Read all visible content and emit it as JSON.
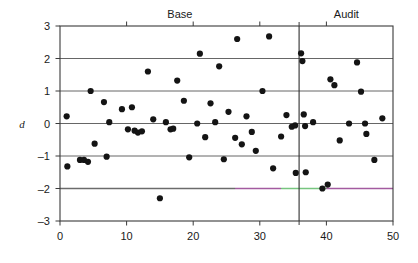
{
  "figure": {
    "title": "",
    "y_axis_title": "d",
    "panels": [
      {
        "label": "Base",
        "x_start": 0,
        "x_end": 35.9
      },
      {
        "label": "Audit",
        "x_start": 35.9,
        "x_end": 50
      }
    ]
  },
  "chart_data": {
    "type": "scatter",
    "title": "",
    "subtitle": "",
    "xlabel": "",
    "ylabel": "d",
    "xlim": [
      0,
      50
    ],
    "ylim": [
      -3,
      3
    ],
    "xticks": [
      0,
      10,
      20,
      30,
      40,
      50
    ],
    "xtick_labels": [
      "0",
      "10",
      "20",
      "30",
      "40",
      "50"
    ],
    "yticks": [
      3,
      2,
      1,
      0,
      -1,
      -2,
      -3
    ],
    "ytick_labels": [
      "3",
      "2",
      "1",
      "0",
      "-1",
      "-2",
      "-3"
    ],
    "grid": true,
    "gridlines_y": [
      2,
      1,
      0,
      -1,
      -2
    ],
    "legend": "none",
    "legend_position": "none",
    "annotations": [
      {
        "type": "panel-label",
        "text": "Base",
        "x": 18,
        "y": 3.35
      },
      {
        "type": "panel-label",
        "text": "Audit",
        "x": 43,
        "y": 3.35
      },
      {
        "type": "vertical-divider",
        "x": 35.9
      }
    ],
    "reference_line": {
      "y": -2,
      "segments": [
        {
          "x_start": 0,
          "x_end": 26.3,
          "color": "#6b6b6b"
        },
        {
          "x_start": 26.3,
          "x_end": 33.2,
          "color": "#a35ba0"
        },
        {
          "x_start": 33.2,
          "x_end": 40.0,
          "color": "#77c57f"
        },
        {
          "x_start": 40.0,
          "x_end": 50.0,
          "color": "#a35ba0"
        }
      ]
    },
    "series": [
      {
        "name": "d",
        "marker": "filled-circle",
        "color": "#141414",
        "points": [
          [
            1.0,
            0.22
          ],
          [
            1.1,
            -1.32
          ],
          [
            3.0,
            -1.12
          ],
          [
            3.6,
            -1.12
          ],
          [
            4.2,
            -1.18
          ],
          [
            4.6,
            1.0
          ],
          [
            5.2,
            -0.62
          ],
          [
            6.6,
            0.66
          ],
          [
            7.0,
            -1.02
          ],
          [
            7.4,
            0.04
          ],
          [
            9.3,
            0.44
          ],
          [
            10.2,
            -0.18
          ],
          [
            10.8,
            0.5
          ],
          [
            11.2,
            -0.22
          ],
          [
            11.7,
            -0.28
          ],
          [
            12.3,
            -0.24
          ],
          [
            13.2,
            1.6
          ],
          [
            14.0,
            0.13
          ],
          [
            15.0,
            -2.3
          ],
          [
            15.9,
            0.04
          ],
          [
            16.6,
            -0.18
          ],
          [
            17.0,
            -0.16
          ],
          [
            17.6,
            1.32
          ],
          [
            18.6,
            0.7
          ],
          [
            19.4,
            -1.04
          ],
          [
            20.6,
            0.0
          ],
          [
            21.0,
            2.15
          ],
          [
            21.8,
            -0.42
          ],
          [
            22.6,
            0.62
          ],
          [
            23.3,
            0.04
          ],
          [
            23.9,
            1.76
          ],
          [
            24.6,
            -1.1
          ],
          [
            25.3,
            0.36
          ],
          [
            26.3,
            -0.44
          ],
          [
            26.6,
            2.6
          ],
          [
            27.3,
            -0.64
          ],
          [
            28.0,
            0.22
          ],
          [
            28.8,
            -0.26
          ],
          [
            29.4,
            -0.84
          ],
          [
            30.4,
            1.0
          ],
          [
            31.4,
            2.68
          ],
          [
            32.0,
            -1.38
          ],
          [
            33.2,
            -0.4
          ],
          [
            34.0,
            0.26
          ],
          [
            34.8,
            -0.1
          ],
          [
            35.3,
            -0.06
          ],
          [
            35.4,
            -1.52
          ],
          [
            36.2,
            2.16
          ],
          [
            36.4,
            1.92
          ],
          [
            36.6,
            0.28
          ],
          [
            36.8,
            -0.08
          ],
          [
            36.9,
            -1.5
          ],
          [
            38.0,
            0.04
          ],
          [
            39.4,
            -2.0
          ],
          [
            40.2,
            -1.88
          ],
          [
            40.6,
            1.36
          ],
          [
            41.2,
            1.18
          ],
          [
            42.0,
            -0.52
          ],
          [
            43.4,
            0.0
          ],
          [
            44.6,
            1.88
          ],
          [
            45.2,
            0.98
          ],
          [
            45.8,
            0.0
          ],
          [
            46.0,
            -0.32
          ],
          [
            47.2,
            -1.12
          ],
          [
            48.4,
            0.16
          ]
        ]
      }
    ]
  }
}
